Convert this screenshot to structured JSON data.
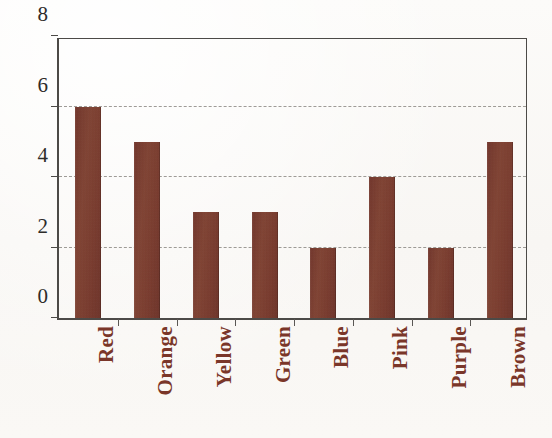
{
  "chart_data": {
    "type": "bar",
    "title": "",
    "subtitle": "",
    "xlabel": "",
    "ylabel": "",
    "categories": [
      "Red",
      "Orange",
      "Yellow",
      "Green",
      "Blue",
      "Pink",
      "Purple",
      "Brown"
    ],
    "values": [
      6,
      5,
      3,
      3,
      2,
      4,
      2,
      5
    ],
    "ylim": [
      0,
      8
    ],
    "ytick_labels": [
      "0",
      "2",
      "4",
      "6",
      "8"
    ],
    "ytick_values": [
      0,
      2,
      4,
      6,
      8
    ],
    "gridlines_at": [
      2,
      4,
      6
    ],
    "grid": true,
    "grid_style": "dashed",
    "legend": false,
    "legend_position": "none",
    "annotations": [],
    "colors": {
      "bar_fill": "#7E3A2C",
      "axis_line": "#4C4A47",
      "grid_line": "#8E8B86",
      "ytick_text": "#2E2C2A",
      "category_text": "#7A3629",
      "background": "#FBFAF8"
    }
  },
  "axes": {
    "y_axis_name": "y-axis",
    "x_axis_name": "x-axis"
  }
}
